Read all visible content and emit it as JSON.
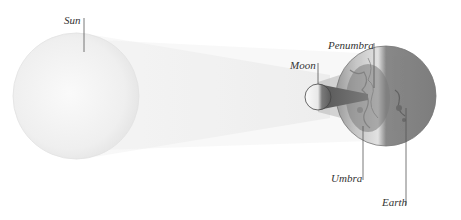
{
  "diagram": {
    "labels": {
      "sun": "Sun",
      "moon": "Moon",
      "penumbra": "Penumbra",
      "umbra": "Umbra",
      "earth": "Earth"
    },
    "colors": {
      "sun": "#f0f0f0",
      "beam": "#e4e4e4",
      "moon_light": "#f7f7f7",
      "moon_dark": "#6e6e6e",
      "umbra": "#5a5a5a",
      "penumbra": "#9a9a9a",
      "earth_lit": "#d8d8d8",
      "earth_dark": "#7a7a7a",
      "leader": "#555555"
    }
  }
}
